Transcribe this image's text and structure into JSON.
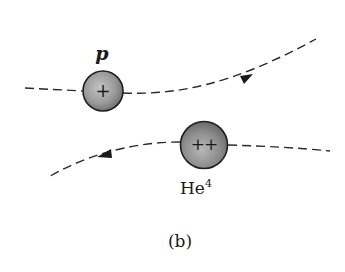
{
  "figure": {
    "caption": "(b)",
    "proton": {
      "label": "p",
      "charge_symbol": "+",
      "direction": "right"
    },
    "helium": {
      "label_base": "He",
      "label_superscript": "4",
      "charge_symbol": "++",
      "direction": "left"
    },
    "colors": {
      "particle_fill_light": "#bdbdbd",
      "particle_fill_dark": "#6e6e6e",
      "stroke": "#2a2a2a"
    }
  }
}
